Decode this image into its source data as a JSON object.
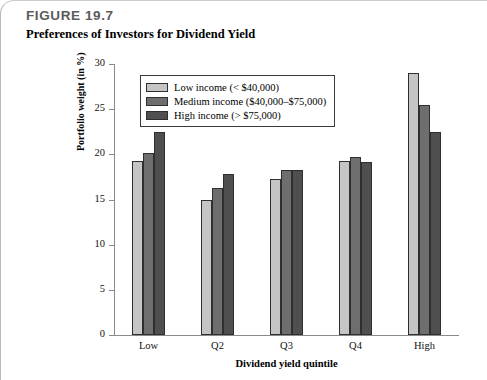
{
  "figure": {
    "number": "FIGURE 19.7",
    "title": "Preferences of Investors for Dividend Yield"
  },
  "chart_data": {
    "type": "bar",
    "title": "Preferences of Investors for Dividend Yield",
    "xlabel": "Dividend yield quintile",
    "ylabel": "Portfolio weight (in %)",
    "categories": [
      "Low",
      "Q2",
      "Q3",
      "Q4",
      "High"
    ],
    "series": [
      {
        "name": "Low income (< $40,000)",
        "color": "#c5c5c5",
        "values": [
          19.3,
          14.9,
          17.3,
          19.3,
          29.0
        ]
      },
      {
        "name": "Medium income ($40,000–$75,000)",
        "color": "#6e6e6e",
        "values": [
          20.1,
          16.3,
          18.3,
          19.7,
          25.5
        ]
      },
      {
        "name": "High income (> $75,000)",
        "color": "#4f4f4f",
        "values": [
          22.5,
          17.8,
          18.3,
          19.1,
          22.5
        ]
      }
    ],
    "ylim": [
      0,
      30
    ],
    "yticks": [
      0,
      5,
      10,
      15,
      20,
      25,
      30
    ],
    "ytick_labels": [
      "0",
      "5",
      "10",
      "15",
      "20",
      "25",
      "30"
    ],
    "grid": false,
    "legend_position": "upper-left-inside"
  }
}
